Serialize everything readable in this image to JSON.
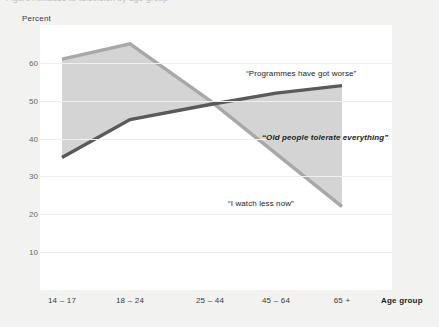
{
  "figure": {
    "caption_sliver": "Figure   Attitudes to television by age group",
    "background_color": "#f2f2f1",
    "plot_background_color": "#ffffff"
  },
  "chart_data": {
    "type": "line",
    "title": "",
    "xlabel": "Age group",
    "ylabel": "Percent",
    "categories": [
      "14 – 17",
      "18 – 24",
      "25 – 44",
      "45 – 64",
      "65 +"
    ],
    "ylim": [
      0,
      70
    ],
    "yticks": [
      10,
      20,
      30,
      40,
      50,
      60
    ],
    "grid": true,
    "legend_position": "inline-annotations",
    "fill_between_series": true,
    "fill_color": "#d4d4d4",
    "series": [
      {
        "name": "“Programmes have got worse”",
        "values": [
          35,
          45,
          49,
          52,
          54
        ],
        "color": "#5a5a5a",
        "style": "solid"
      },
      {
        "name": "“I watch less now”",
        "values": [
          61,
          65,
          50,
          36,
          22
        ],
        "color": "#a8a8a8",
        "style": "solid"
      }
    ],
    "annotations": [
      {
        "text": "“Programmes have got worse”",
        "emphasis": "regular",
        "x_px": 246,
        "y_px": 69
      },
      {
        "text": "“Old people tolerate everything”",
        "emphasis": "italic-bold",
        "x_px": 262,
        "y_px": 133
      },
      {
        "text": "“I watch less now”",
        "emphasis": "regular",
        "x_px": 228,
        "y_px": 199
      }
    ]
  }
}
